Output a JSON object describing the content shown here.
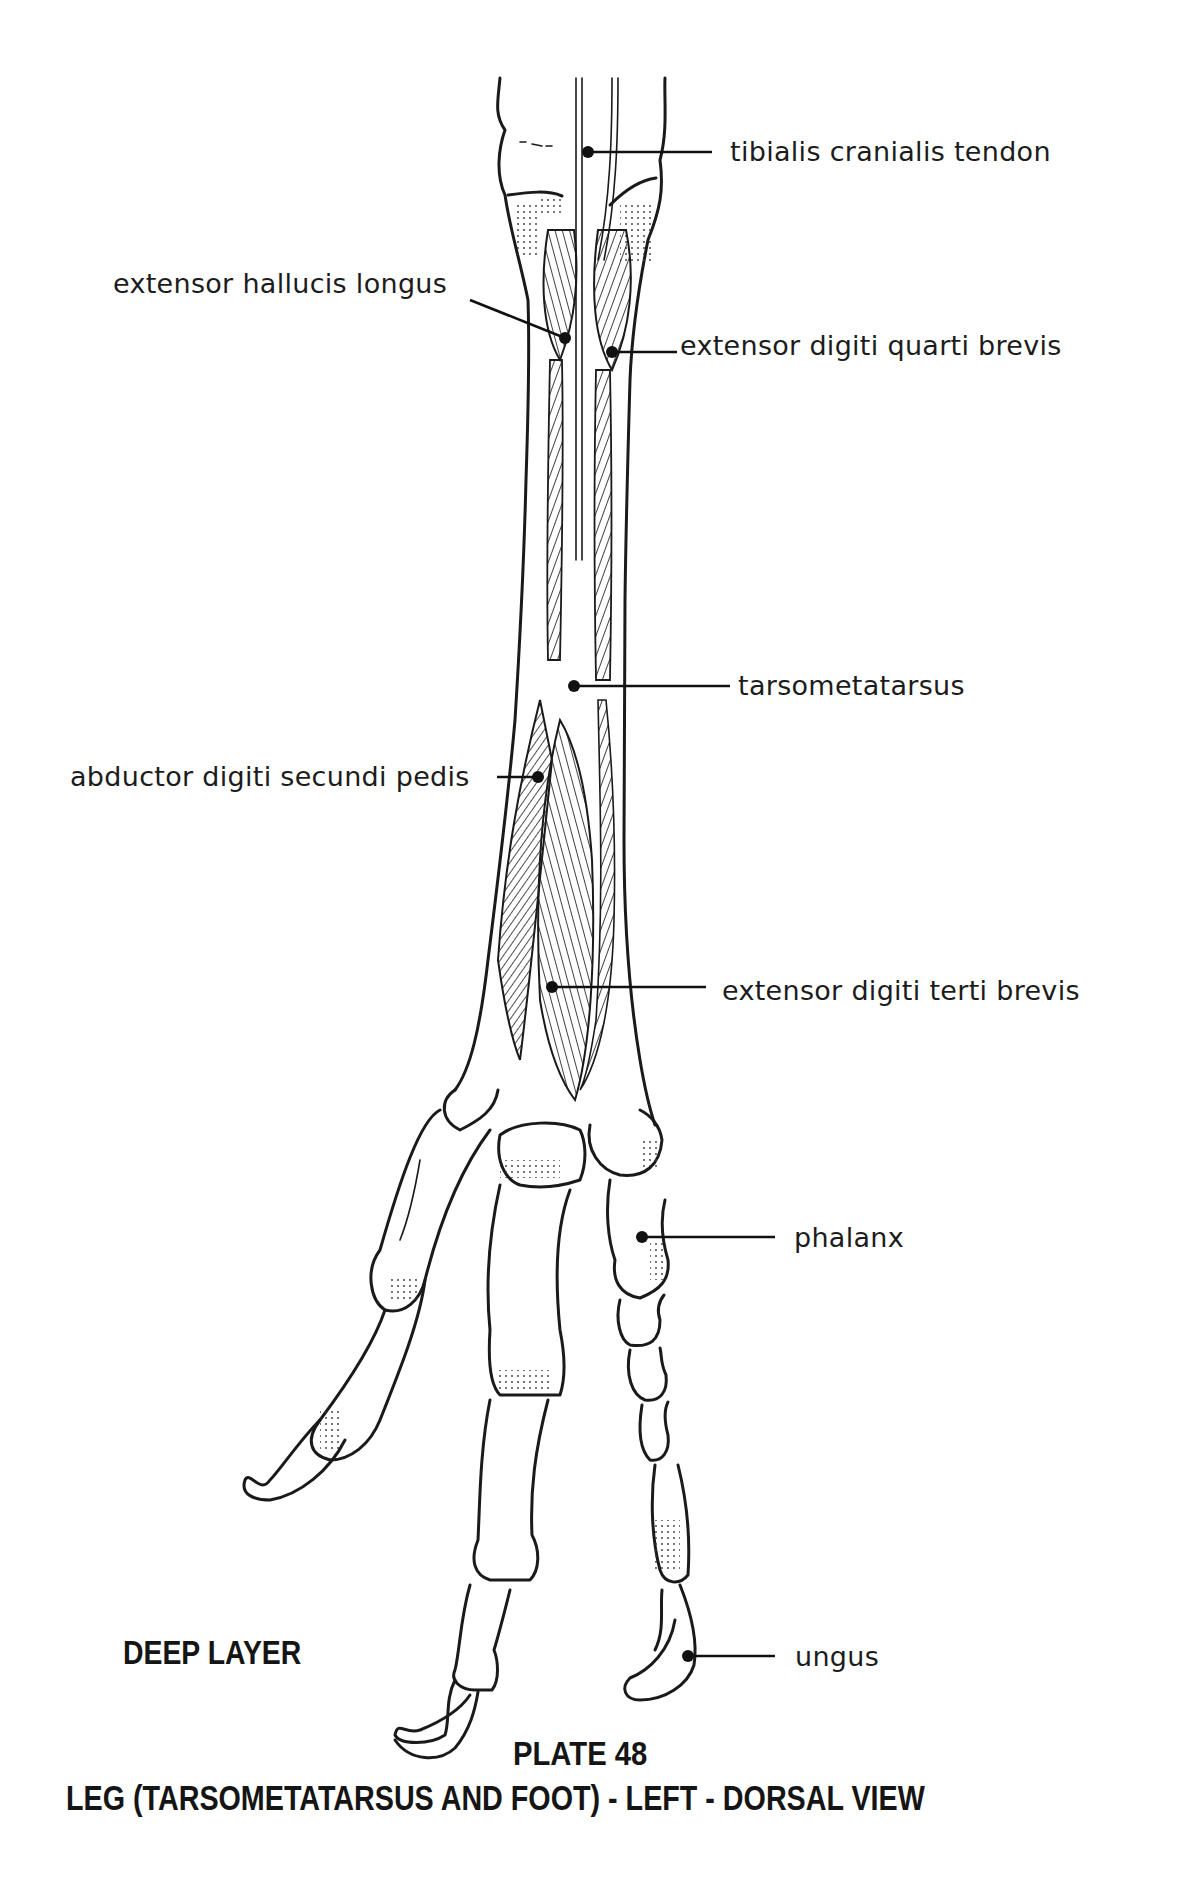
{
  "plate": {
    "layer_label": "DEEP LAYER",
    "plate_number": "PLATE 48",
    "title": "LEG (TARSOMETATARSUS AND FOOT) - LEFT - DORSAL VIEW"
  },
  "labels": [
    {
      "id": "tibialis-cranialis-tendon",
      "text": "tibialis cranialis tendon",
      "side": "right",
      "text_x": 730,
      "text_y": 142,
      "dot": [
        588,
        152
      ],
      "line_end": [
        712,
        152
      ]
    },
    {
      "id": "extensor-hallucis-longus",
      "text": "extensor hallucis longus",
      "side": "left",
      "text_x": 113,
      "text_y": 276,
      "dot": [
        565,
        338
      ],
      "line_end": [
        470,
        300
      ]
    },
    {
      "id": "extensor-digiti-quarti-brevis",
      "text": "extensor digiti quarti brevis",
      "side": "right",
      "text_x": 680,
      "text_y": 333,
      "dot": [
        612,
        352
      ],
      "line_end": [
        677,
        352
      ]
    },
    {
      "id": "tarsometatarsus",
      "text": "tarsometatarsus",
      "side": "right",
      "text_x": 738,
      "text_y": 673,
      "dot": [
        574,
        686
      ],
      "line_end": [
        730,
        686
      ]
    },
    {
      "id": "abductor-digiti-secundi-pedis",
      "text": "abductor digiti secundi pedis",
      "side": "left",
      "text_x": 70,
      "text_y": 765,
      "dot": [
        538,
        777
      ],
      "line_end": [
        497,
        777
      ]
    },
    {
      "id": "extensor-digiti-terti-brevis",
      "text": "extensor digiti terti brevis",
      "side": "right",
      "text_x": 722,
      "text_y": 983,
      "dot": [
        552,
        987
      ],
      "line_end": [
        706,
        987
      ]
    },
    {
      "id": "phalanx",
      "text": "phalanx",
      "side": "right",
      "text_x": 794,
      "text_y": 1226,
      "dot": [
        642,
        1237
      ],
      "line_end": [
        775,
        1237
      ]
    },
    {
      "id": "ungus",
      "text": "ungus",
      "side": "right",
      "text_x": 795,
      "text_y": 1648,
      "dot": [
        688,
        1656
      ],
      "line_end": [
        775,
        1656
      ]
    }
  ]
}
